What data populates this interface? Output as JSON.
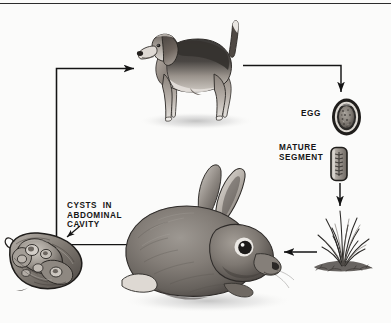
{
  "figure": {
    "background_color": "#fbfbfa",
    "line_color": "#141414",
    "text_color": "#151515"
  },
  "labels": {
    "egg": "EGG",
    "mature_segment": "MATURE\nSEGMENT",
    "cysts": "CYSTS  IN\nABDOMINAL\nCAVITY"
  },
  "illustrations": {
    "dog": {
      "name": "beagle-dog",
      "caption": "",
      "facing": "left"
    },
    "rabbit": {
      "name": "rabbit",
      "caption": "",
      "facing": "right"
    },
    "egg": {
      "name": "tapeworm-egg",
      "caption": "EGG"
    },
    "segment": {
      "name": "mature-proglottid-segment",
      "caption": "MATURE SEGMENT"
    },
    "grass": {
      "name": "grass-tuft",
      "caption": ""
    },
    "cysts": {
      "name": "cysts-in-abdominal-cavity-organ",
      "caption": "CYSTS IN ABDOMINAL CAVITY"
    }
  },
  "arrows": [
    {
      "name": "cysts-to-dog",
      "from": "cysts",
      "to": "dog",
      "direction": "right"
    },
    {
      "name": "dog-to-egg",
      "from": "dog",
      "to": "egg",
      "direction": "down"
    },
    {
      "name": "segment-to-grass",
      "from": "mature-segment",
      "to": "grass",
      "direction": "down"
    },
    {
      "name": "grass-to-rabbit",
      "from": "grass",
      "to": "rabbit",
      "direction": "left"
    },
    {
      "name": "rabbit-to-cysts",
      "from": "rabbit-abdomen",
      "to": "cysts",
      "direction": "left"
    },
    {
      "name": "cysts-label-pointer",
      "from": "cysts-label",
      "to": "cysts",
      "direction": "down-left"
    }
  ]
}
